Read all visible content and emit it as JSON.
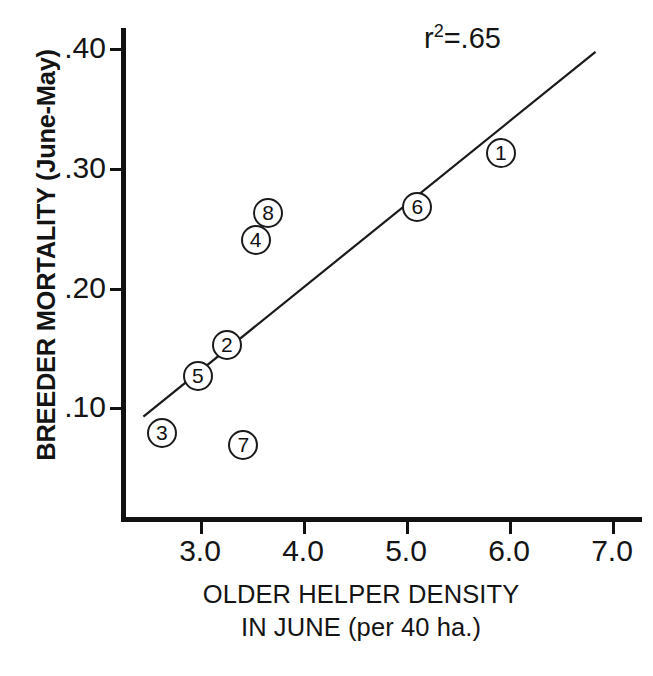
{
  "chart_data": {
    "type": "scatter",
    "title": "",
    "xlabel": "OLDER HELPER DENSITY IN JUNE (per 40 ha.)",
    "xlabel_line1": "OLDER HELPER DENSITY",
    "xlabel_line2": "IN JUNE (per 40 ha.)",
    "ylabel": "BREEDER MORTALITY (June-May)",
    "xlim": [
      2.3,
      7.3
    ],
    "ylim": [
      0.0,
      0.42
    ],
    "xticks": [
      "3.0",
      "4.0",
      "5.0",
      "6.0",
      "7.0"
    ],
    "xtick_values": [
      3.0,
      4.0,
      5.0,
      6.0,
      7.0
    ],
    "yticks": [
      ".40",
      ".30",
      ".20",
      ".10"
    ],
    "ytick_values": [
      0.4,
      0.3,
      0.2,
      0.1
    ],
    "grid": false,
    "legend": "none",
    "annotations": [
      {
        "name": "r-squared",
        "text_prefix": "r",
        "text_superscript": "2",
        "text_suffix": "=.65",
        "full_text": "r2=.65",
        "value": 0.65
      }
    ],
    "points": [
      {
        "label": "1",
        "x": 5.92,
        "y": 0.312
      },
      {
        "label": "2",
        "x": 3.26,
        "y": 0.152
      },
      {
        "label": "3",
        "x": 2.63,
        "y": 0.078
      },
      {
        "label": "4",
        "x": 3.54,
        "y": 0.24
      },
      {
        "label": "5",
        "x": 2.98,
        "y": 0.126
      },
      {
        "label": "6",
        "x": 5.11,
        "y": 0.267
      },
      {
        "label": "7",
        "x": 3.42,
        "y": 0.068
      },
      {
        "label": "8",
        "x": 3.66,
        "y": 0.262
      }
    ],
    "fit_line": {
      "name": "regression-line",
      "x_start": 2.45,
      "y_start": 0.092,
      "x_end": 6.84,
      "y_end": 0.397
    },
    "marker_style": "open-circle-with-number",
    "colors": {
      "axis": "#111111",
      "marker_edge": "#1a1a1a",
      "marker_fill": "#ffffff",
      "line": "#1a1a1a",
      "text": "#141414",
      "background": "#ffffff"
    }
  }
}
